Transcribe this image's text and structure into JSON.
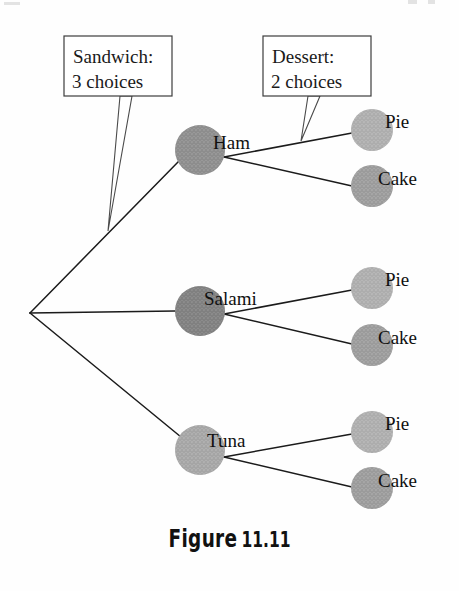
{
  "figure": {
    "caption_prefix": "Figure",
    "caption_number": "11.11",
    "background_color": "#fefefe",
    "line_color": "#1b1b1b"
  },
  "callouts": [
    {
      "name": "sandwich-callout",
      "line1": "Sandwich:",
      "line2": "3 choices",
      "box": {
        "x": 64,
        "y": 36,
        "w": 108,
        "h": 60
      },
      "pointer_tip": {
        "x": 108,
        "y": 231
      }
    },
    {
      "name": "dessert-callout",
      "line1": "Dessert:",
      "line2": "2 choices",
      "box": {
        "x": 263,
        "y": 36,
        "w": 108,
        "h": 60
      },
      "pointer_tip": {
        "x": 301,
        "y": 141
      }
    }
  ],
  "tree": {
    "root": {
      "name": "root-vertex",
      "x": 30,
      "y": 313
    },
    "level1": [
      {
        "label": "Ham",
        "x": 200,
        "y": 150,
        "r": 25,
        "color": "#8c8c8c"
      },
      {
        "label": "Salami",
        "x": 200,
        "y": 311,
        "r": 25,
        "color": "#7a7a7a"
      },
      {
        "label": "Tuna",
        "x": 200,
        "y": 450,
        "r": 25,
        "color": "#aeaeae"
      }
    ],
    "level2": [
      {
        "label": "Pie",
        "x": 372,
        "y": 130,
        "r": 21,
        "color": "#b8b8b8",
        "parent": "Ham"
      },
      {
        "label": "Cake",
        "x": 372,
        "y": 186,
        "r": 21,
        "color": "#a0a0a0",
        "parent": "Ham"
      },
      {
        "label": "Pie",
        "x": 372,
        "y": 288,
        "r": 21,
        "color": "#b8b8b8",
        "parent": "Salami"
      },
      {
        "label": "Cake",
        "x": 372,
        "y": 345,
        "r": 21,
        "color": "#a0a0a0",
        "parent": "Salami"
      },
      {
        "label": "Pie",
        "x": 372,
        "y": 432,
        "r": 21,
        "color": "#b8b8b8",
        "parent": "Tuna"
      },
      {
        "label": "Cake",
        "x": 372,
        "y": 488,
        "r": 21,
        "color": "#a0a0a0",
        "parent": "Tuna"
      }
    ]
  }
}
